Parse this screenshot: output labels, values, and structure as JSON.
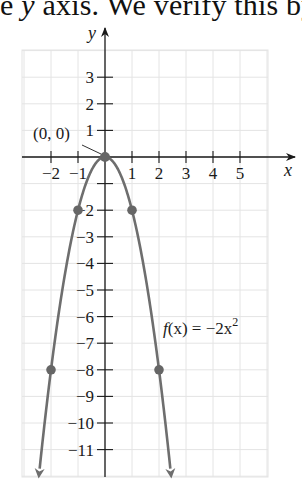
{
  "caption": {
    "prefix": "e ",
    "italic": "y",
    "suffix": " axis. We verify this by"
  },
  "chart_data": {
    "type": "line",
    "title": "",
    "xlabel": "x",
    "ylabel": "y",
    "xlim": [
      -3,
      6.5
    ],
    "ylim": [
      -12,
      4
    ],
    "grid": true,
    "x_ticks": [
      -2,
      -1,
      1,
      2,
      3,
      4,
      5
    ],
    "x_tick_labels": [
      "−2",
      "−1",
      "1",
      "2",
      "3",
      "4",
      "5"
    ],
    "y_ticks": [
      3,
      2,
      1,
      -2,
      -3,
      -4,
      -5,
      -6,
      -7,
      -8,
      -9,
      -10,
      -11
    ],
    "y_tick_labels": [
      "3",
      "2",
      "1",
      "−2",
      "−3",
      "−4",
      "−5",
      "−6",
      "−7",
      "−8",
      "−9",
      "−10",
      "−11"
    ],
    "series": [
      {
        "name": "f(x) = −2x²",
        "function": "-2*x^2",
        "color": "#6e6e6e",
        "x": [
          -2.42,
          -2,
          -1.5,
          -1,
          -0.5,
          0,
          0.5,
          1,
          1.5,
          2,
          2.42
        ],
        "y": [
          -11.7,
          -8,
          -4.5,
          -2,
          -0.5,
          0,
          -0.5,
          -2,
          -4.5,
          -8,
          -11.7
        ],
        "arrows": "both-ends-down"
      }
    ],
    "points": [
      {
        "x": 0,
        "y": 0,
        "label": "(0, 0)"
      },
      {
        "x": -1,
        "y": -2
      },
      {
        "x": 1,
        "y": -2
      },
      {
        "x": -2,
        "y": -8
      },
      {
        "x": 2,
        "y": -8
      }
    ],
    "annotations": [
      {
        "text": "(0, 0)",
        "points_to": [
          0,
          0
        ]
      },
      {
        "text": "f(x) = −2x²",
        "near": [
          2.3,
          -6.5
        ]
      }
    ],
    "legend": "none"
  },
  "labels": {
    "origin": "(0, 0)",
    "func_f": "f",
    "func_x": "(x) = −2x",
    "func_exp": "2",
    "x_axis": "x",
    "y_axis": "y"
  },
  "colors": {
    "curve": "#6e6e6e",
    "axis": "#1a1a1a",
    "grid": "#e4e4e4",
    "point": "#666666"
  }
}
